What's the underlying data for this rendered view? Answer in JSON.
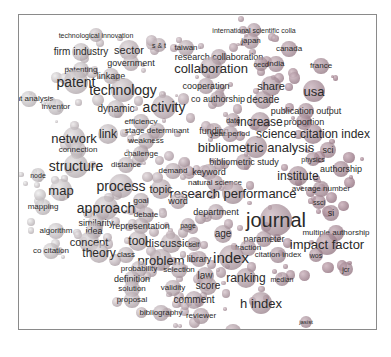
{
  "figure": {
    "type": "term co-occurrence map",
    "terms": [
      {
        "label": "technological innovation",
        "x": 95,
        "y": 34,
        "size": 7
      },
      {
        "label": "international scientific colla",
        "x": 253,
        "y": 29,
        "size": 7
      },
      {
        "label": "japan",
        "x": 250,
        "y": 40,
        "size": 8
      },
      {
        "label": "firm industry",
        "x": 80,
        "y": 51,
        "size": 10
      },
      {
        "label": "sector",
        "x": 128,
        "y": 49,
        "size": 11
      },
      {
        "label": "s & t",
        "x": 158,
        "y": 44,
        "size": 7
      },
      {
        "label": "taiwan",
        "x": 185,
        "y": 47,
        "size": 8
      },
      {
        "label": "canada",
        "x": 288,
        "y": 48,
        "size": 8
      },
      {
        "label": "research collaboration",
        "x": 218,
        "y": 56,
        "size": 9
      },
      {
        "label": "government",
        "x": 130,
        "y": 62,
        "size": 9
      },
      {
        "label": "collaboration",
        "x": 210,
        "y": 67,
        "size": 13
      },
      {
        "label": "oecd",
        "x": 260,
        "y": 63,
        "size": 7
      },
      {
        "label": "india",
        "x": 275,
        "y": 63,
        "size": 8
      },
      {
        "label": "france",
        "x": 320,
        "y": 65,
        "size": 8
      },
      {
        "label": "patenting",
        "x": 80,
        "y": 69,
        "size": 8
      },
      {
        "label": "linkage",
        "x": 110,
        "y": 75,
        "size": 9
      },
      {
        "label": "patent",
        "x": 75,
        "y": 81,
        "size": 14
      },
      {
        "label": "technology",
        "x": 122,
        "y": 89,
        "size": 14
      },
      {
        "label": "cooperation",
        "x": 205,
        "y": 85,
        "size": 9
      },
      {
        "label": "share",
        "x": 270,
        "y": 85,
        "size": 11
      },
      {
        "label": "usa",
        "x": 313,
        "y": 90,
        "size": 13
      },
      {
        "label": "atent analysis",
        "x": 28,
        "y": 98,
        "size": 8
      },
      {
        "label": "co authorship",
        "x": 217,
        "y": 98,
        "size": 9
      },
      {
        "label": "decade",
        "x": 262,
        "y": 99,
        "size": 10
      },
      {
        "label": "inventor",
        "x": 55,
        "y": 106,
        "size": 8
      },
      {
        "label": "dynamic",
        "x": 115,
        "y": 108,
        "size": 10
      },
      {
        "label": "activity",
        "x": 163,
        "y": 106,
        "size": 14
      },
      {
        "label": "publication output",
        "x": 305,
        "y": 110,
        "size": 9
      },
      {
        "label": "efficiency",
        "x": 140,
        "y": 121,
        "size": 8
      },
      {
        "label": "date",
        "x": 232,
        "y": 119,
        "size": 7
      },
      {
        "label": "increase",
        "x": 259,
        "y": 121,
        "size": 12
      },
      {
        "label": "proportion",
        "x": 303,
        "y": 121,
        "size": 9
      },
      {
        "label": "stage determinant",
        "x": 156,
        "y": 130,
        "size": 8
      },
      {
        "label": "link",
        "x": 107,
        "y": 133,
        "size": 12
      },
      {
        "label": "network",
        "x": 73,
        "y": 137,
        "size": 13
      },
      {
        "label": "funding",
        "x": 213,
        "y": 130,
        "size": 9
      },
      {
        "label": "year period",
        "x": 229,
        "y": 133,
        "size": 8
      },
      {
        "label": "science citation index",
        "x": 312,
        "y": 133,
        "size": 12
      },
      {
        "label": "weakness",
        "x": 145,
        "y": 140,
        "size": 8
      },
      {
        "label": "bibliometric analysis",
        "x": 255,
        "y": 146,
        "size": 13
      },
      {
        "label": "sci",
        "x": 327,
        "y": 149,
        "size": 9
      },
      {
        "label": "connection",
        "x": 77,
        "y": 149,
        "size": 8
      },
      {
        "label": "challenge",
        "x": 140,
        "y": 153,
        "size": 8
      },
      {
        "label": "physics",
        "x": 312,
        "y": 158,
        "size": 7
      },
      {
        "label": "bibliometric study",
        "x": 243,
        "y": 161,
        "size": 9
      },
      {
        "label": "authorship",
        "x": 340,
        "y": 168,
        "size": 9
      },
      {
        "label": "structure",
        "x": 75,
        "y": 165,
        "size": 14
      },
      {
        "label": "distance",
        "x": 125,
        "y": 164,
        "size": 8
      },
      {
        "label": "institute",
        "x": 297,
        "y": 175,
        "size": 12
      },
      {
        "label": "node",
        "x": 37,
        "y": 174,
        "size": 7
      },
      {
        "label": "demand",
        "x": 172,
        "y": 170,
        "size": 8
      },
      {
        "label": "keyword",
        "x": 208,
        "y": 171,
        "size": 9
      },
      {
        "label": "average number",
        "x": 320,
        "y": 188,
        "size": 8
      },
      {
        "label": "natural science",
        "x": 214,
        "y": 182,
        "size": 8
      },
      {
        "label": "process",
        "x": 120,
        "y": 185,
        "size": 14
      },
      {
        "label": "topic",
        "x": 160,
        "y": 188,
        "size": 11
      },
      {
        "label": "research performance",
        "x": 232,
        "y": 192,
        "size": 13
      },
      {
        "label": "ssci",
        "x": 318,
        "y": 201,
        "size": 7
      },
      {
        "label": "map",
        "x": 60,
        "y": 189,
        "size": 13
      },
      {
        "label": "goal",
        "x": 140,
        "y": 200,
        "size": 8
      },
      {
        "label": "word",
        "x": 177,
        "y": 200,
        "size": 9
      },
      {
        "label": "department",
        "x": 215,
        "y": 211,
        "size": 9
      },
      {
        "label": "mapping",
        "x": 42,
        "y": 206,
        "size": 8
      },
      {
        "label": "approach",
        "x": 105,
        "y": 207,
        "size": 14
      },
      {
        "label": "journal",
        "x": 275,
        "y": 219,
        "size": 20
      },
      {
        "label": "si",
        "x": 330,
        "y": 212,
        "size": 9
      },
      {
        "label": "debate",
        "x": 145,
        "y": 214,
        "size": 8
      },
      {
        "label": "similarity",
        "x": 95,
        "y": 222,
        "size": 9
      },
      {
        "label": "representation",
        "x": 140,
        "y": 225,
        "size": 9
      },
      {
        "label": "page",
        "x": 187,
        "y": 224,
        "size": 7
      },
      {
        "label": "algorithm",
        "x": 55,
        "y": 230,
        "size": 8
      },
      {
        "label": "idea",
        "x": 93,
        "y": 230,
        "size": 9
      },
      {
        "label": "age",
        "x": 222,
        "y": 233,
        "size": 10
      },
      {
        "label": "multiple authorship",
        "x": 335,
        "y": 232,
        "size": 8
      },
      {
        "label": "parameter",
        "x": 263,
        "y": 238,
        "size": 9
      },
      {
        "label": "concept",
        "x": 88,
        "y": 241,
        "size": 11
      },
      {
        "label": "tool",
        "x": 137,
        "y": 240,
        "size": 12
      },
      {
        "label": "discussion",
        "x": 170,
        "y": 242,
        "size": 11
      },
      {
        "label": "self",
        "x": 193,
        "y": 243,
        "size": 7
      },
      {
        "label": "impact factor",
        "x": 326,
        "y": 243,
        "size": 13
      },
      {
        "label": "fraction",
        "x": 247,
        "y": 247,
        "size": 8
      },
      {
        "label": "co citation",
        "x": 50,
        "y": 250,
        "size": 8
      },
      {
        "label": "theory",
        "x": 98,
        "y": 252,
        "size": 12
      },
      {
        "label": "class",
        "x": 125,
        "y": 254,
        "size": 8
      },
      {
        "label": "citation index",
        "x": 277,
        "y": 254,
        "size": 8
      },
      {
        "label": "wos",
        "x": 315,
        "y": 254,
        "size": 7
      },
      {
        "label": "index",
        "x": 230,
        "y": 256,
        "size": 15
      },
      {
        "label": "problem",
        "x": 160,
        "y": 259,
        "size": 13
      },
      {
        "label": "library",
        "x": 198,
        "y": 258,
        "size": 9
      },
      {
        "label": "probability",
        "x": 138,
        "y": 268,
        "size": 8
      },
      {
        "label": "selection",
        "x": 178,
        "y": 269,
        "size": 8
      },
      {
        "label": "jcr",
        "x": 345,
        "y": 268,
        "size": 7
      },
      {
        "label": "law",
        "x": 204,
        "y": 275,
        "size": 10
      },
      {
        "label": "ranking",
        "x": 245,
        "y": 277,
        "size": 12
      },
      {
        "label": "median",
        "x": 281,
        "y": 278,
        "size": 7
      },
      {
        "label": "definition",
        "x": 131,
        "y": 278,
        "size": 9
      },
      {
        "label": "solution",
        "x": 131,
        "y": 288,
        "size": 8
      },
      {
        "label": "validity",
        "x": 172,
        "y": 287,
        "size": 8
      },
      {
        "label": "score",
        "x": 207,
        "y": 285,
        "size": 10
      },
      {
        "label": "proposal",
        "x": 131,
        "y": 299,
        "size": 8
      },
      {
        "label": "comment",
        "x": 193,
        "y": 299,
        "size": 10
      },
      {
        "label": "h index",
        "x": 260,
        "y": 302,
        "size": 13
      },
      {
        "label": "bibliography",
        "x": 160,
        "y": 312,
        "size": 8
      },
      {
        "label": "reviewer",
        "x": 200,
        "y": 315,
        "size": 8
      },
      {
        "label": "jasist",
        "x": 305,
        "y": 321,
        "size": 6
      },
      {
        "label": "hirsch",
        "x": 232,
        "y": 331,
        "size": 8
      }
    ],
    "colors": {
      "border": "#8a8a8a",
      "text": "#2a2a2a",
      "bubble_left": "#c4c4c4",
      "bubble_right": "#b08a92"
    }
  }
}
